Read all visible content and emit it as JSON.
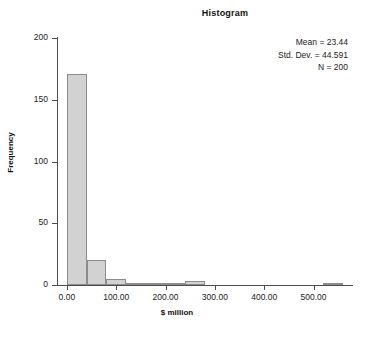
{
  "chart_data": {
    "type": "bar",
    "title": "Histogram",
    "xlabel": "$ million",
    "ylabel": "Frequency",
    "xlim": [
      -20,
      580
    ],
    "ylim": [
      0,
      200
    ],
    "bin_width": 40,
    "grid": false,
    "legend": "none",
    "bin_starts": [
      0,
      40,
      80,
      120,
      160,
      200,
      240,
      520
    ],
    "categories": [
      "0-40",
      "40-80",
      "80-120",
      "120-160",
      "160-200",
      "200-240",
      "240-280",
      "520-560"
    ],
    "values": [
      171,
      20,
      5,
      2,
      2,
      1,
      3,
      2
    ],
    "xticks": [
      0,
      100,
      200,
      300,
      400,
      500
    ],
    "xtick_labels": [
      "0.00",
      "100.00",
      "200.00",
      "300.00",
      "400.00",
      "500.00"
    ],
    "yticks": [
      0,
      50,
      100,
      150,
      200
    ],
    "ytick_labels": [
      "0",
      "50",
      "100",
      "150",
      "200"
    ],
    "bar_fill": "#d2d2d2",
    "bar_edge": "#8c8c8c",
    "annotations": [
      "Mean = 23.44",
      "Std. Dev. = 44.591",
      "N = 200"
    ]
  }
}
